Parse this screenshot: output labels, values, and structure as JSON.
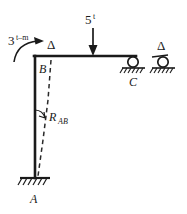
{
  "diagram": {
    "member_color": "#1a1a1a",
    "dashed_color": "#2a2a2a",
    "labels": {
      "moment_value": "3",
      "moment_unit": "t–m",
      "point_load_value": "5",
      "point_load_unit": "t",
      "joint_b": "B",
      "joint_c": "C",
      "support_a": "A",
      "rotation": "R",
      "rotation_sub": "AB",
      "delta_left": "Δ",
      "delta_right": "Δ"
    },
    "icons": {
      "moment_arrow": "curved-moment-arrow-icon",
      "load_arrow": "down-arrow-icon",
      "roller_support": "roller-support-icon",
      "fixed_support": "fixed-support-icon",
      "angle_arc": "angle-arc-icon",
      "deflected_shape": "dashed-deflection-icon"
    }
  }
}
